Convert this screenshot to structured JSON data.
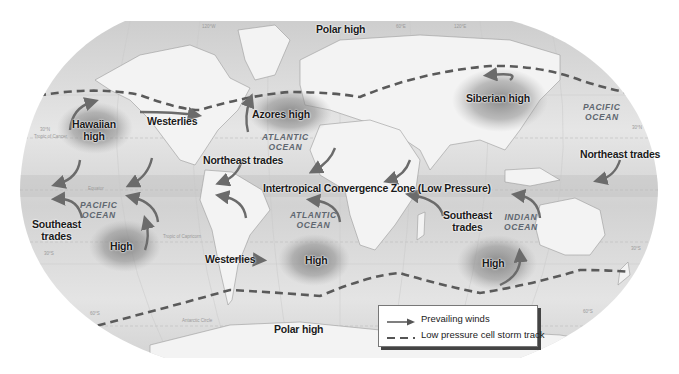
{
  "map": {
    "title": "Global atmospheric pressure cells and prevailing winds",
    "pressure_cells": [
      {
        "id": "polar-high-north",
        "label": "Polar high"
      },
      {
        "id": "hawaiian-high",
        "label": "Hawaiian\nhigh",
        "line1": "Hawaiian",
        "line2": "high"
      },
      {
        "id": "azores-high",
        "label": "Azores high"
      },
      {
        "id": "siberian-high",
        "label": "Siberian high"
      },
      {
        "id": "south-pacific-high",
        "label": "High"
      },
      {
        "id": "south-atlantic-high",
        "label": "High"
      },
      {
        "id": "indian-ocean-high",
        "label": "High"
      },
      {
        "id": "polar-high-south",
        "label": "Polar high"
      }
    ],
    "wind_labels": {
      "westerlies_north": "Westerlies",
      "westerlies_south": "Westerlies",
      "northeast_trades_atlantic": "Northeast trades",
      "northeast_trades_pacific": "Northeast trades",
      "southeast_trades_pacific_line1": "Southeast",
      "southeast_trades_pacific_line2": "trades",
      "southeast_trades_indian_line1": "Southeast",
      "southeast_trades_indian_line2": "trades",
      "itcz": "Intertropical Convergence Zone  (Low Pressure)"
    },
    "oceans": {
      "atlantic_north_line1": "ATLANTIC",
      "atlantic_north_line2": "OCEAN",
      "atlantic_south_line1": "ATLANTIC",
      "atlantic_south_line2": "OCEAN",
      "pacific_west_line1": "PACIFIC",
      "pacific_west_line2": "OCEAN",
      "pacific_east_line1": "PACIFIC",
      "pacific_east_line2": "OCEAN",
      "indian_line1": "INDIAN",
      "indian_line2": "OCEAN"
    },
    "graticule": {
      "lat_30n_left": "30°N",
      "tropic_cancer": "Tropic of Cancer",
      "equator": "Equator",
      "tropic_capricorn": "Tropic of Capricorn",
      "lat_30s_left": "30°S",
      "lat_60s_left": "60°S",
      "antarctic_circle": "Antarctic Circle",
      "lat_30n_right": "30°N",
      "lat_30s_right": "30°S",
      "lat_60s_right": "60°S",
      "lon_top_1": "120°W",
      "lon_top_2": "60°E",
      "lon_top_3": "120°E"
    },
    "colors": {
      "background": "#ffffff",
      "ocean": "#dcdcdc",
      "land": "#f2f2f2",
      "high_cell": "#8a8a8a",
      "arrow": "#6b6b6b",
      "storm_track": "#5a5a5a",
      "text": "#1a1a1a",
      "ocean_text": "#5f6770"
    }
  },
  "legend": {
    "items": [
      {
        "symbol": "solid-arrow",
        "label": "Prevailing winds"
      },
      {
        "symbol": "dashed-line",
        "label": "Low pressure cell storm track"
      }
    ]
  }
}
